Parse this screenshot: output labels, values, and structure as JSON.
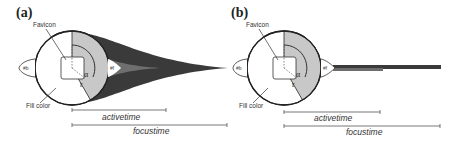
{
  "panels": [
    {
      "label": "(a)",
      "variant": "tapered-ribbon",
      "annotations": {
        "favicon": "Favicon",
        "fill_color": "Fill color",
        "alpha": "α",
        "r": "r",
        "tb": "#b",
        "tf": "#f"
      },
      "timelines": {
        "activetime": "activetime",
        "focustime": "focustime"
      }
    },
    {
      "label": "(b)",
      "variant": "bar",
      "annotations": {
        "favicon": "Favicon",
        "fill_color": "Fill color",
        "alpha": "α",
        "r": "r",
        "tb": "#b",
        "tf": "#f"
      },
      "timelines": {
        "activetime": "activetime",
        "focustime": "focustime"
      }
    }
  ],
  "colors": {
    "wedge": "#c8c8c8",
    "ribbon_dark": "#3a3a3a",
    "ribbon_mid": "#6e6e6e",
    "outline": "#222222",
    "timeline": "#555555"
  }
}
